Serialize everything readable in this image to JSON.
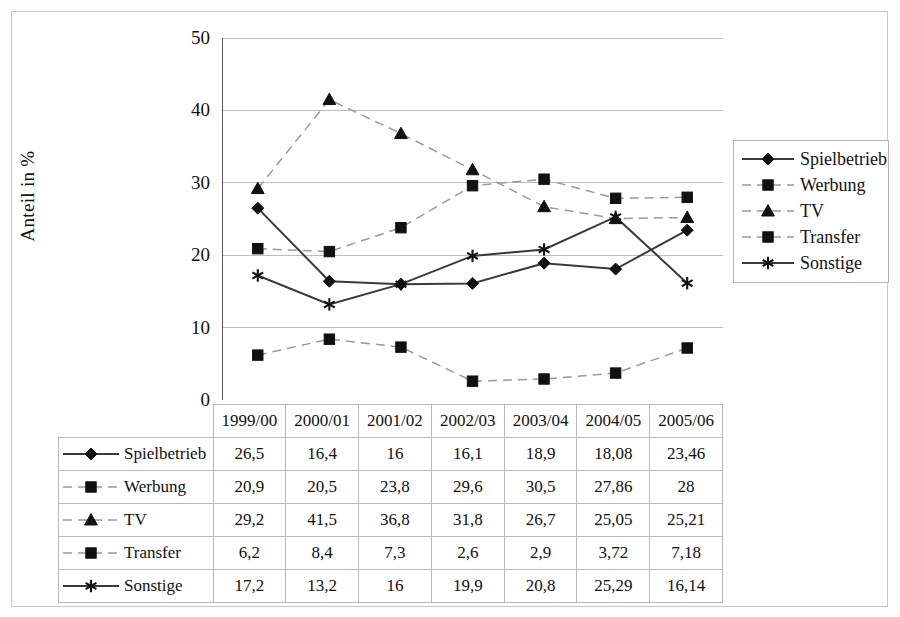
{
  "axis": {
    "y_title": "Anteil in %",
    "y_ticks": [
      "0",
      "10",
      "20",
      "30",
      "40",
      "50"
    ]
  },
  "legend": {
    "items": [
      {
        "label": "Spielbetrieb",
        "marker": "diamond",
        "line": "solid",
        "color": "#1a1a1a",
        "line_color": "#3a3a3a"
      },
      {
        "label": "Werbung",
        "marker": "square",
        "line": "dashed",
        "color": "#1a1a1a",
        "line_color": "#9a9a9a"
      },
      {
        "label": "TV",
        "marker": "triangle",
        "line": "dashed",
        "color": "#1a1a1a",
        "line_color": "#9a9a9a"
      },
      {
        "label": "Transfer",
        "marker": "square",
        "line": "dashed",
        "color": "#1a1a1a",
        "line_color": "#9a9a9a"
      },
      {
        "label": "Sonstige",
        "marker": "star",
        "line": "solid",
        "color": "#1a1a1a",
        "line_color": "#3a3a3a"
      }
    ]
  },
  "table": {
    "corner_label": "",
    "columns": [
      "1999/00",
      "2000/01",
      "2001/02",
      "2002/03",
      "2003/04",
      "2004/05",
      "2005/06"
    ],
    "rows": [
      {
        "label": "Spielbetrieb",
        "values": [
          "26,5",
          "16,4",
          "16",
          "16,1",
          "18,9",
          "18,08",
          "23,46"
        ]
      },
      {
        "label": "Werbung",
        "values": [
          "20,9",
          "20,5",
          "23,8",
          "29,6",
          "30,5",
          "27,86",
          "28"
        ]
      },
      {
        "label": "TV",
        "values": [
          "29,2",
          "41,5",
          "36,8",
          "31,8",
          "26,7",
          "25,05",
          "25,21"
        ]
      },
      {
        "label": "Transfer",
        "values": [
          "6,2",
          "8,4",
          "7,3",
          "2,6",
          "2,9",
          "3,72",
          "7,18"
        ]
      },
      {
        "label": "Sonstige",
        "values": [
          "17,2",
          "13,2",
          "16",
          "19,9",
          "20,8",
          "25,29",
          "16,14"
        ]
      }
    ]
  },
  "chart_data": {
    "type": "line",
    "title": "",
    "xlabel": "",
    "ylabel": "Anteil in %",
    "ylim": [
      0,
      50
    ],
    "ytick_step": 10,
    "grid": true,
    "legend_position": "right",
    "categories": [
      "1999/00",
      "2000/01",
      "2001/02",
      "2002/03",
      "2003/04",
      "2004/05",
      "2005/06"
    ],
    "series": [
      {
        "name": "Spielbetrieb",
        "marker": "diamond",
        "line": "solid",
        "color": "#3a3a3a",
        "values": [
          26.5,
          16.4,
          16,
          16.1,
          18.9,
          18.08,
          23.46
        ]
      },
      {
        "name": "Werbung",
        "marker": "square",
        "line": "dashed",
        "color": "#9a9a9a",
        "values": [
          20.9,
          20.5,
          23.8,
          29.6,
          30.5,
          27.86,
          28
        ]
      },
      {
        "name": "TV",
        "marker": "triangle",
        "line": "dashed",
        "color": "#9a9a9a",
        "values": [
          29.2,
          41.5,
          36.8,
          31.8,
          26.7,
          25.05,
          25.21
        ]
      },
      {
        "name": "Transfer",
        "marker": "square",
        "line": "dashed",
        "color": "#9a9a9a",
        "values": [
          6.2,
          8.4,
          7.3,
          2.6,
          2.9,
          3.72,
          7.18
        ]
      },
      {
        "name": "Sonstige",
        "marker": "star",
        "line": "solid",
        "color": "#3a3a3a",
        "values": [
          17.2,
          13.2,
          16,
          19.9,
          20.8,
          25.29,
          16.14
        ]
      }
    ]
  }
}
